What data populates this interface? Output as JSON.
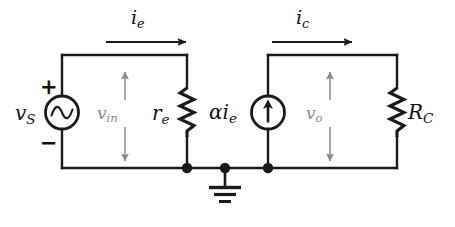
{
  "figure": {
    "background_color": "#ffffff",
    "wire_color": "#1a1a1a",
    "dim_color": "#8a8a8a"
  },
  "labels": {
    "source_voltage": "v",
    "source_voltage_sub": "S",
    "input_voltage": "v",
    "input_voltage_sub": "in",
    "output_voltage": "v",
    "output_voltage_sub": "o",
    "emitter_resistor": "r",
    "emitter_resistor_sub": "e",
    "collector_resistor": "R",
    "collector_resistor_sub": "C",
    "emitter_current": "i",
    "emitter_current_sub": "e",
    "collector_current": "i",
    "collector_current_sub": "c",
    "dependent_source": "αi",
    "dependent_source_sub": "e",
    "plus_sign": "+",
    "minus_sign": "−"
  },
  "components": [
    {
      "id": "source-vs",
      "kind": "ac-voltage-source",
      "label": "vS",
      "terminals": [
        "+ top",
        "− bottom"
      ]
    },
    {
      "id": "resistor-re",
      "kind": "resistor",
      "label": "re"
    },
    {
      "id": "current-source-alpha-ie",
      "kind": "dependent-current-source",
      "label": "αie",
      "arrow_direction": "up"
    },
    {
      "id": "resistor-rc",
      "kind": "resistor",
      "label": "RC"
    },
    {
      "id": "ground",
      "kind": "earth-ground",
      "label": ""
    }
  ],
  "annotations": [
    {
      "id": "ie-arrow",
      "label": "ie",
      "direction": "right",
      "loop": "input"
    },
    {
      "id": "ic-arrow",
      "label": "ic",
      "direction": "right",
      "loop": "output"
    },
    {
      "id": "vin-arrow",
      "label": "vin",
      "direction": "double-vertical",
      "loop": "input"
    },
    {
      "id": "vo-arrow",
      "label": "vo",
      "direction": "double-vertical",
      "loop": "output"
    }
  ]
}
